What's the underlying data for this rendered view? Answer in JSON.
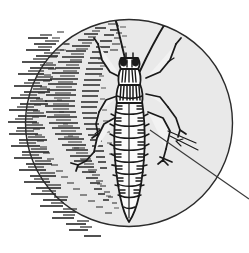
{
  "figure": {
    "style": "vintage line engraving, hatched shading",
    "caption": "Magnified insect specimen with leader line",
    "background_color": "#ffffff",
    "ink_color": "#1a1a1a",
    "lens_fill_color": "#e9e9e9",
    "lens_rim_color": "#2b2b2b",
    "shadow_hatch_color": "#262626"
  },
  "lens": {
    "label": "magnifier-lens-circle",
    "center_x": 129,
    "center_y": 123,
    "radius": 104,
    "rim_width": 1.4,
    "fill": "#e9e9e9"
  },
  "leader_line": {
    "label": "magnifier-handle-leader-line",
    "x1": 150,
    "y1": 130,
    "x2": 249,
    "y2": 199,
    "stroke_width": 1.1,
    "color": "#3a3a3a"
  },
  "insect": {
    "name": "insect-body",
    "orientation": "head-up",
    "parts": [
      {
        "name": "antenna-left",
        "description": "long slender antenna curving up-left"
      },
      {
        "name": "antenna-right",
        "description": "long slender antenna curving up-right"
      },
      {
        "name": "head",
        "description": "rounded head with two dark compound eyes"
      },
      {
        "name": "eye-left",
        "description": "dark oval compound eye"
      },
      {
        "name": "eye-right",
        "description": "dark oval compound eye"
      },
      {
        "name": "pronotum",
        "description": "striped thorax shield behind head"
      },
      {
        "name": "thorax",
        "description": "banded mid-body with vertical hatch stripes"
      },
      {
        "name": "abdomen",
        "description": "elongated segmented abdomen tapering to a point"
      },
      {
        "name": "leg-foreleg-left",
        "description": "front left leg angled outward"
      },
      {
        "name": "leg-foreleg-right",
        "description": "front right leg angled outward"
      },
      {
        "name": "leg-midleg-left",
        "description": "middle left leg"
      },
      {
        "name": "leg-midleg-right",
        "description": "middle right leg"
      },
      {
        "name": "leg-hindleg-left",
        "description": "rear left leg extending down-left"
      },
      {
        "name": "leg-hindleg-right",
        "description": "rear hind leg extending down-right"
      }
    ],
    "abdomen_segment_count": 9
  },
  "shading": {
    "interior_hatch_label": "interior-shadow-hatching",
    "exterior_hatch_label": "exterior-radial-hatching",
    "interior_dash_count": 420,
    "exterior_dash_count": 150,
    "description": "short horizontal dashes forming a shadow plume at upper-left inside the lens and radiating ticks outside the left rim"
  }
}
